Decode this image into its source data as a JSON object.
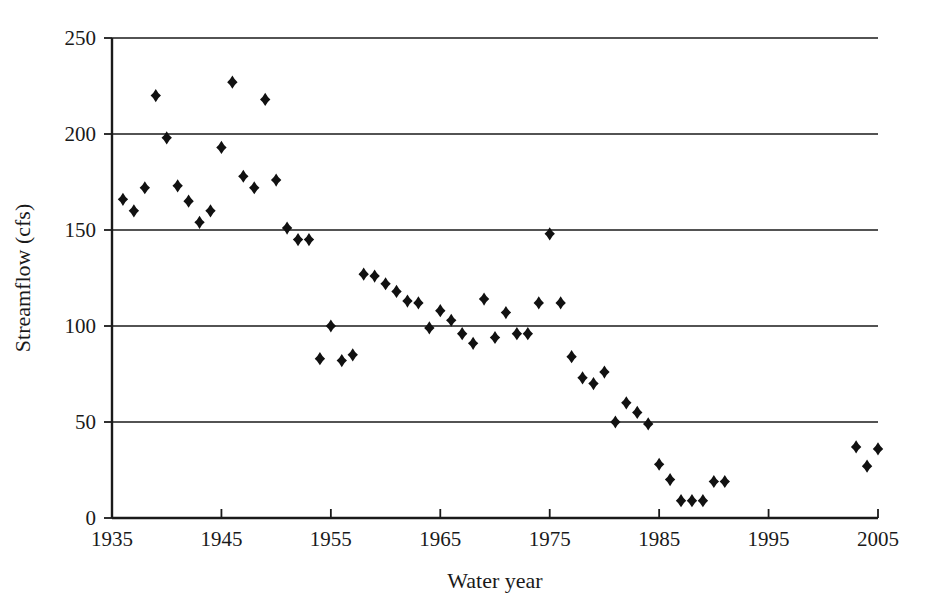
{
  "chart_data": {
    "type": "scatter",
    "title": "",
    "xlabel": "Water year",
    "ylabel": "Streamflow (cfs)",
    "xlim": [
      1935,
      2005
    ],
    "ylim": [
      0,
      250
    ],
    "xticks": [
      1935,
      1945,
      1955,
      1965,
      1975,
      1985,
      1995,
      2005
    ],
    "xtick_labels": [
      "1935",
      "1945",
      "1955",
      "1965",
      "1975",
      "1985",
      "1995",
      "2005"
    ],
    "yticks": [
      0,
      50,
      100,
      150,
      200,
      250
    ],
    "ytick_labels": [
      "0",
      "50",
      "100",
      "150",
      "200",
      "250"
    ],
    "grid": "horizontal",
    "legend": "none",
    "marker": "diamond",
    "marker_color": "#111111",
    "series": [
      {
        "name": "Streamflow",
        "x": [
          1936,
          1937,
          1938,
          1939,
          1940,
          1941,
          1942,
          1943,
          1944,
          1945,
          1946,
          1947,
          1948,
          1949,
          1950,
          1951,
          1952,
          1953,
          1954,
          1955,
          1956,
          1957,
          1958,
          1959,
          1960,
          1961,
          1962,
          1963,
          1964,
          1965,
          1966,
          1967,
          1968,
          1969,
          1970,
          1971,
          1972,
          1973,
          1974,
          1975,
          1976,
          1977,
          1978,
          1979,
          1980,
          1981,
          1982,
          1983,
          1984,
          1985,
          1986,
          1987,
          1988,
          1989,
          1990,
          1991,
          2003,
          2004,
          2005
        ],
        "y": [
          166,
          160,
          172,
          220,
          198,
          173,
          165,
          154,
          160,
          193,
          227,
          178,
          172,
          218,
          176,
          151,
          145,
          145,
          83,
          100,
          82,
          85,
          127,
          126,
          122,
          118,
          113,
          112,
          99,
          108,
          103,
          96,
          91,
          114,
          94,
          107,
          96,
          96,
          112,
          148,
          112,
          84,
          73,
          70,
          76,
          50,
          60,
          55,
          49,
          28,
          20,
          9,
          9,
          9,
          19,
          19,
          37,
          27,
          36
        ]
      }
    ]
  },
  "figure": {
    "background_color": "#ffffff",
    "axis_color": "#1a1a1a"
  }
}
